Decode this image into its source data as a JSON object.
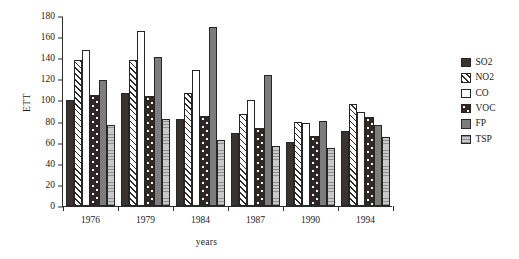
{
  "chart_data": {
    "type": "bar",
    "title": "",
    "xlabel": "years",
    "ylabel": "ETT",
    "categories": [
      "1976",
      "1979",
      "1984",
      "1987",
      "1990",
      "1994"
    ],
    "ylim": [
      0,
      180
    ],
    "ytick_step": 20,
    "yticks": [
      0,
      20,
      40,
      60,
      80,
      100,
      120,
      140,
      160,
      180
    ],
    "grid": false,
    "legend_position": "right",
    "series": [
      {
        "name": "SO2",
        "values": [
          100,
          107,
          82,
          69,
          61,
          71
        ],
        "color": "#3b3330",
        "pattern": "solid-dark"
      },
      {
        "name": "NO2",
        "values": [
          138,
          138,
          107,
          87,
          80,
          97
        ],
        "color": "#ffffff",
        "pattern": "diagonal-hatch"
      },
      {
        "name": "CO",
        "values": [
          148,
          166,
          129,
          100,
          79,
          89
        ],
        "color": "#ffffff",
        "pattern": "empty"
      },
      {
        "name": "VOC",
        "values": [
          105,
          104,
          85,
          74,
          66,
          84
        ],
        "color": "#2e2724",
        "pattern": "dark-dotted"
      },
      {
        "name": "FP",
        "values": [
          119,
          141,
          170,
          124,
          81,
          77
        ],
        "color": "#7d7d7d",
        "pattern": "solid-gray"
      },
      {
        "name": "TSP",
        "values": [
          77,
          82,
          63,
          57,
          55,
          65
        ],
        "color": "#b9b9b9",
        "pattern": "light-horizontal-lines"
      }
    ]
  },
  "legend": {
    "items": [
      {
        "label": "SO2"
      },
      {
        "label": "NO2"
      },
      {
        "label": "CO"
      },
      {
        "label": "VOC"
      },
      {
        "label": "FP"
      },
      {
        "label": "TSP"
      }
    ]
  }
}
